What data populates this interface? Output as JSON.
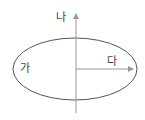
{
  "diagram": {
    "labels": {
      "ga": "가",
      "na": "나",
      "da": "다"
    },
    "colors": {
      "ellipse_stroke": "#555555",
      "axis_stroke": "#9a9a9a",
      "text": "#444444"
    },
    "shapes": {
      "ellipse": {
        "cx": 75,
        "cy": 69,
        "rx": 62,
        "ry": 31
      },
      "vertical_arrow": {
        "x": 76,
        "y_from": 113,
        "y_to": 12
      },
      "horizontal_arrow": {
        "y": 69,
        "x_from": 76,
        "x_to": 135
      }
    }
  }
}
